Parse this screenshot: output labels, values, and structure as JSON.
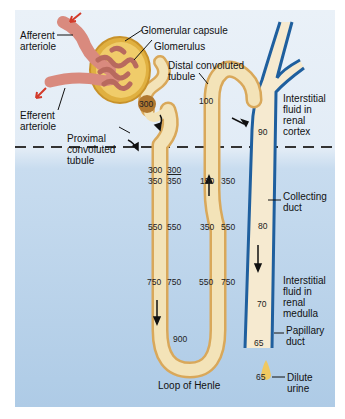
{
  "labels": {
    "afferent_arteriole": "Afferent\narteriole",
    "efferent_arteriole": "Efferent\narteriole",
    "glomerular_capsule": "Glomerular capsule",
    "glomerulus": "Glomerulus",
    "distal_convoluted_tubule": "Distal convoluted\ntubule",
    "proximal_convoluted_tubule": "Proximal\nconvoluted\ntubule",
    "interstitial_fluid_cortex": "Interstitial\nfluid in\nrenal\ncortex",
    "collecting_duct": "Collecting\nduct",
    "interstitial_fluid_medulla": "Interstitial\nfluid in\nrenal\nmedulla",
    "papillary_duct": "Papillary\nduct",
    "loop_of_henle": "Loop of Henle",
    "dilute_urine": "Dilute\nurine"
  },
  "osmolarity": {
    "glomerular_capsule_exit": "300",
    "pct_end": "300",
    "interstitial_cortex_boundary": "300",
    "descending_top_tubule": "350",
    "descending_top_fluid": "350",
    "descending_mid_tubule": "550",
    "descending_mid_fluid": "550",
    "descending_low_tubule": "750",
    "descending_low_fluid": "750",
    "loop_bottom": "900",
    "ascending_top_tubule": "150",
    "ascending_top_fluid": "350",
    "ascending_mid_tubule": "350",
    "ascending_mid_fluid": "550",
    "ascending_low_tubule": "550",
    "ascending_low_fluid": "750",
    "dct": "100",
    "collecting_cortex": "90",
    "collecting_upper_medulla": "80",
    "collecting_lower_medulla": "70",
    "papillary_duct": "65",
    "urine": "65"
  },
  "colors": {
    "tubule_fill": "#f3e3b8",
    "tubule_edge": "#d9a85a",
    "duct_edge": "#1f5f9e",
    "arteriole": "#d98a7e",
    "capsule": "#e0b040",
    "arrow_red": "#d33a2a",
    "background_cortex": "#e6eef7",
    "background_medulla": "#b5d0e9"
  }
}
